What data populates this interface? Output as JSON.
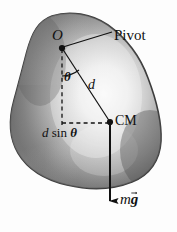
{
  "figure": {
    "background_color": "#fdfdfd",
    "ink_color": "#111111",
    "body_outline_color": "#3c3c3c",
    "body_fill_light": "#f4f4f4",
    "body_fill_mid": "#8e8e8e",
    "body_fill_dark": "#4a4a4a",
    "labels": {
      "pivot_point": "O",
      "pivot_callout": "Pivot",
      "angle": "θ",
      "distance": "d",
      "moment_arm_d": "d",
      "moment_arm_sin": "sin",
      "moment_arm_theta": "θ",
      "center_of_mass": "CM",
      "weight_mass": "m",
      "weight_gravity": "g"
    },
    "geometry": {
      "pivot_x": 62,
      "pivot_y": 48,
      "cm_x": 110,
      "cm_y": 122,
      "vertical_line_bottom_y": 126,
      "weight_arrow_tip_x": 110,
      "weight_arrow_tip_y": 208,
      "callout_line_end_x": 112,
      "callout_line_end_y": 32
    }
  }
}
